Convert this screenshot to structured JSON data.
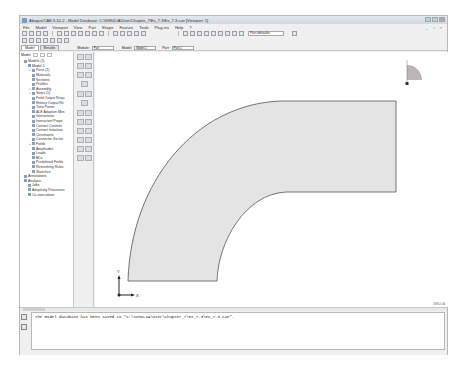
{
  "window": {
    "title": "Abaqus/CAE 6.10-2 - Model Database: C:\\SIMULIA\\User\\Chapter_7\\Ex_7-3\\Ex_7-3.cae [Viewport: 1]"
  },
  "menubar": {
    "items": [
      "File",
      "Model",
      "Viewport",
      "View",
      "Part",
      "Shape",
      "Feature",
      "Tools",
      "Plug-ins",
      "Help",
      "?"
    ]
  },
  "toolbar": {
    "render_style": "Part defaults"
  },
  "tabs": [
    {
      "label": "Model",
      "active": true
    },
    {
      "label": "Results",
      "active": false
    }
  ],
  "context": {
    "module_label": "Module:",
    "module_value": "Part",
    "model_label": "Model:",
    "model_value": "Model-1",
    "part_label": "Part:",
    "part_value": "Part-1"
  },
  "tree": {
    "toolbar_label": "Model",
    "nodes": [
      {
        "label": "Models (1)",
        "level": 0,
        "exp": "-"
      },
      {
        "label": "Model-1",
        "level": 1,
        "exp": "-"
      },
      {
        "label": "Parts (1)",
        "level": 2,
        "exp": "+"
      },
      {
        "label": "Materials",
        "level": 2,
        "exp": ""
      },
      {
        "label": "Sections",
        "level": 2,
        "exp": ""
      },
      {
        "label": "Profiles",
        "level": 2,
        "exp": ""
      },
      {
        "label": "Assembly",
        "level": 2,
        "exp": "+"
      },
      {
        "label": "Steps (1)",
        "level": 2,
        "exp": "+"
      },
      {
        "label": "Field Output Requ",
        "level": 2,
        "exp": ""
      },
      {
        "label": "History Output Re",
        "level": 2,
        "exp": ""
      },
      {
        "label": "Time Points",
        "level": 2,
        "exp": ""
      },
      {
        "label": "ALE Adaptive Mes",
        "level": 2,
        "exp": ""
      },
      {
        "label": "Interactions",
        "level": 2,
        "exp": ""
      },
      {
        "label": "Interaction Prope",
        "level": 2,
        "exp": ""
      },
      {
        "label": "Contact Controls",
        "level": 2,
        "exp": ""
      },
      {
        "label": "Contact Initializat",
        "level": 2,
        "exp": ""
      },
      {
        "label": "Constraints",
        "level": 2,
        "exp": ""
      },
      {
        "label": "Connector Sectio",
        "level": 2,
        "exp": ""
      },
      {
        "label": "Fields",
        "level": 2,
        "exp": "+"
      },
      {
        "label": "Amplitudes",
        "level": 2,
        "exp": ""
      },
      {
        "label": "Loads",
        "level": 2,
        "exp": ""
      },
      {
        "label": "BCs",
        "level": 2,
        "exp": ""
      },
      {
        "label": "Predefined Fields",
        "level": 2,
        "exp": ""
      },
      {
        "label": "Remeshing Rules",
        "level": 2,
        "exp": ""
      },
      {
        "label": "Sketches",
        "level": 2,
        "exp": ""
      },
      {
        "label": "Annotations",
        "level": 0,
        "exp": ""
      },
      {
        "label": "Analysis",
        "level": 0,
        "exp": "-"
      },
      {
        "label": "Jobs",
        "level": 1,
        "exp": ""
      },
      {
        "label": "Adaptivity Processes",
        "level": 1,
        "exp": ""
      },
      {
        "label": "Co-executions",
        "level": 1,
        "exp": ""
      }
    ]
  },
  "viewport": {
    "axis_x": "X",
    "axis_y": "Y",
    "part_fill": "#e4e4e4",
    "part_edge": "#555555"
  },
  "status": {
    "brand": "SIMULIA"
  },
  "messages": [
    "The model database has been saved to \"C:\\SIMULIA\\User\\Chapter_7\\Ex_7-3\\Ex_7-3.cae\"."
  ]
}
